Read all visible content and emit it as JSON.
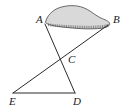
{
  "figure": {
    "type": "geometry-diagram",
    "background_color": "#ffffff",
    "stroke_color": "#2b2b2b",
    "region": {
      "name": "shaded-blob",
      "fill_color": "#d8d8d8",
      "outline_color": "#555555",
      "hatch_color": "#4a4a4a",
      "hatch_marks": 34,
      "description": "irregular shaded region spanning from A to B"
    },
    "points": [
      {
        "id": "A",
        "label": "A",
        "label_x": 36,
        "label_y": 14,
        "x": 45,
        "y": 24
      },
      {
        "id": "B",
        "label": "B",
        "label_x": 113,
        "label_y": 14,
        "x": 108,
        "y": 25
      },
      {
        "id": "C",
        "label": "C",
        "label_x": 68,
        "label_y": 54,
        "x": 64,
        "y": 57
      },
      {
        "id": "D",
        "label": "D",
        "label_x": 73,
        "label_y": 96,
        "x": 75,
        "y": 93
      },
      {
        "id": "E",
        "label": "E",
        "label_x": 9,
        "label_y": 96,
        "x": 13,
        "y": 93
      }
    ],
    "segments": [
      {
        "id": "AD",
        "from": "A",
        "to": "D"
      },
      {
        "id": "BE",
        "from": "B",
        "to": "E"
      },
      {
        "id": "ED",
        "from": "E",
        "to": "D"
      }
    ]
  }
}
